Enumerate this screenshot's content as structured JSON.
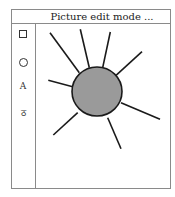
{
  "window": {
    "title": "Picture edit mode ..."
  },
  "toolbar": {
    "tools": [
      {
        "name": "rectangle-tool",
        "icon": "square-icon",
        "glyph": ""
      },
      {
        "name": "ellipse-tool",
        "icon": "circle-icon",
        "glyph": ""
      },
      {
        "name": "text-tool",
        "icon": "text-icon",
        "glyph": "A"
      },
      {
        "name": "freehand-tool",
        "icon": "lasso-icon",
        "glyph": "ठ"
      }
    ]
  },
  "drawing": {
    "shapes": [
      {
        "type": "ellipse",
        "cx": 96,
        "cy": 90.5,
        "rx": 25,
        "ry": 24.5,
        "fill": "#9a9a9a",
        "stroke": "#1a1a1a"
      }
    ],
    "lines": [
      {
        "x1": 49,
        "y1": 31.7,
        "x2": 78.3,
        "y2": 71.7
      },
      {
        "x1": 79.3,
        "y1": 28.3,
        "x2": 88.3,
        "y2": 66.7
      },
      {
        "x1": 109.3,
        "y1": 31,
        "x2": 101.7,
        "y2": 66.7
      },
      {
        "x1": 141,
        "y1": 50.7,
        "x2": 115,
        "y2": 74.3
      },
      {
        "x1": 47.3,
        "y1": 79.3,
        "x2": 71.7,
        "y2": 85.7
      },
      {
        "x1": 120,
        "y1": 101.7,
        "x2": 159,
        "y2": 118.3
      },
      {
        "x1": 76.7,
        "y1": 111.7,
        "x2": 52.3,
        "y2": 134
      },
      {
        "x1": 106.7,
        "y1": 116.7,
        "x2": 120,
        "y2": 147.7
      }
    ],
    "line_color": "#1a1a1a"
  }
}
